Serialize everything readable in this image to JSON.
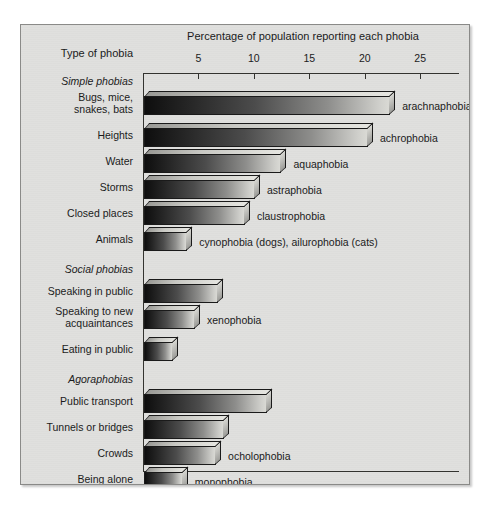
{
  "chart_data": {
    "type": "bar",
    "orientation": "horizontal",
    "title": "Percentage of population reporting each phobia",
    "axis_header": "Type of phobia",
    "xlabel": "",
    "ylabel": "",
    "xlim": [
      0,
      28.5
    ],
    "xticks": [
      5,
      10,
      15,
      20,
      25
    ],
    "xtick_labels": [
      "5",
      "10",
      "15",
      "20",
      "25"
    ],
    "grid": false,
    "legend": "none",
    "groups": [
      {
        "name": "Simple phobias",
        "italic": true,
        "items": [
          {
            "category": "Bugs, mice,\nsnakes, bats",
            "value": 22.2,
            "annotation": "arachnaphobia (spiders)"
          },
          {
            "category": "Heights",
            "value": 20.2,
            "annotation": "achrophobia"
          },
          {
            "category": "Water",
            "value": 12.4,
            "annotation": "aquaphobia"
          },
          {
            "category": "Storms",
            "value": 10.0,
            "annotation": "astraphobia"
          },
          {
            "category": "Closed places",
            "value": 9.1,
            "annotation": "claustrophobia"
          },
          {
            "category": "Animals",
            "value": 3.9,
            "annotation": "cynophobia (dogs), ailurophobia (cats)"
          }
        ]
      },
      {
        "name": "Social phobias",
        "italic": true,
        "items": [
          {
            "category": "Speaking in public",
            "value": 6.7,
            "annotation": ""
          },
          {
            "category": "Speaking to new\nacquaintances",
            "value": 4.6,
            "annotation": "xenophobia"
          },
          {
            "category": "Eating in public",
            "value": 2.6,
            "annotation": ""
          }
        ]
      },
      {
        "name": "Agoraphobias",
        "italic": true,
        "items": [
          {
            "category": "Public transport",
            "value": 11.1,
            "annotation": ""
          },
          {
            "category": "Tunnels or bridges",
            "value": 7.2,
            "annotation": ""
          },
          {
            "category": "Crowds",
            "value": 6.5,
            "annotation": "ocholophobia"
          },
          {
            "category": "Being alone",
            "value": 3.5,
            "annotation": "monophobia"
          },
          {
            "category": "Going out by oneself",
            "value": 3.4,
            "annotation": ""
          }
        ]
      }
    ]
  },
  "colors": {
    "panel_background": "#e0e0de",
    "panel_border": "#8a8a88",
    "axis": "#33332f",
    "text": "#1b1b1b",
    "bar_dark": "#0e0e0e",
    "bar_light": "#d9d9d4"
  }
}
